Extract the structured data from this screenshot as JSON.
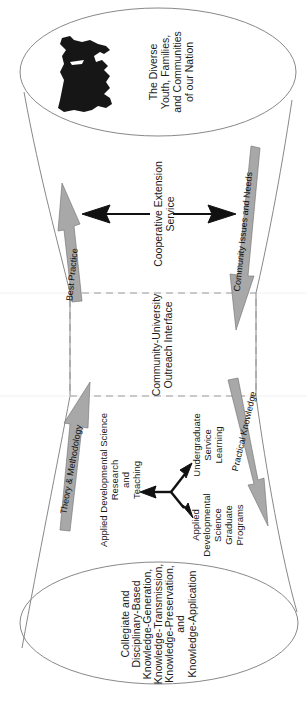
{
  "diagram": {
    "orientation": "rotated 90 degrees counter-clockwise",
    "top_ellipse": {
      "icon": "usa-map-icon",
      "lines": [
        "The Diverse",
        "Youth, Families,",
        "and Communities",
        "of our Nation"
      ]
    },
    "upper_section": {
      "lines": [
        "Cooperative Extension",
        "Service"
      ]
    },
    "interface": {
      "lines": [
        "Community-University",
        "Outreach Interface"
      ]
    },
    "lower_section": {
      "main_lines": [
        "Applied Developmental Science",
        "Research",
        "and",
        "Teaching"
      ],
      "branch_upper_lines": [
        "Undergraduate",
        "Service",
        "Learning"
      ],
      "branch_lower_lines": [
        "Applied",
        "Developmental",
        "Science",
        "Graduate",
        "Programs"
      ]
    },
    "bottom_ellipse": {
      "lines": [
        "Collegiate and",
        "Disciplinary-Based",
        "Knowledge-Generation,",
        "Knowledge-Transmission,",
        "Knowledge-Preservation,",
        "and",
        "Knowledge-Application"
      ]
    },
    "flow_arrows": {
      "best_practice": "Best Practice",
      "community_issues": "Community Issues and Needs",
      "theory_methodology": "Theory & Methodology",
      "practical_knowledge": "Practical Knowledge"
    },
    "colors": {
      "flow_arrow_fill": "#a8a8a8",
      "outline": "#7a7a7a",
      "dash": "#9a9a9a",
      "black_arrow": "#111111"
    }
  }
}
